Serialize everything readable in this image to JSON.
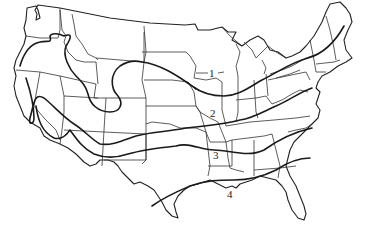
{
  "map": {
    "description": "Outline map of the contiguous United States with state boundaries and four numbered zone boundary lines",
    "line_color": "#222222",
    "background": "#ffffff"
  },
  "zones": [
    {
      "id": 1,
      "label": "1"
    },
    {
      "id": 2,
      "label": "2"
    },
    {
      "id": 3,
      "label": "3"
    },
    {
      "id": 4,
      "label": "4"
    }
  ]
}
